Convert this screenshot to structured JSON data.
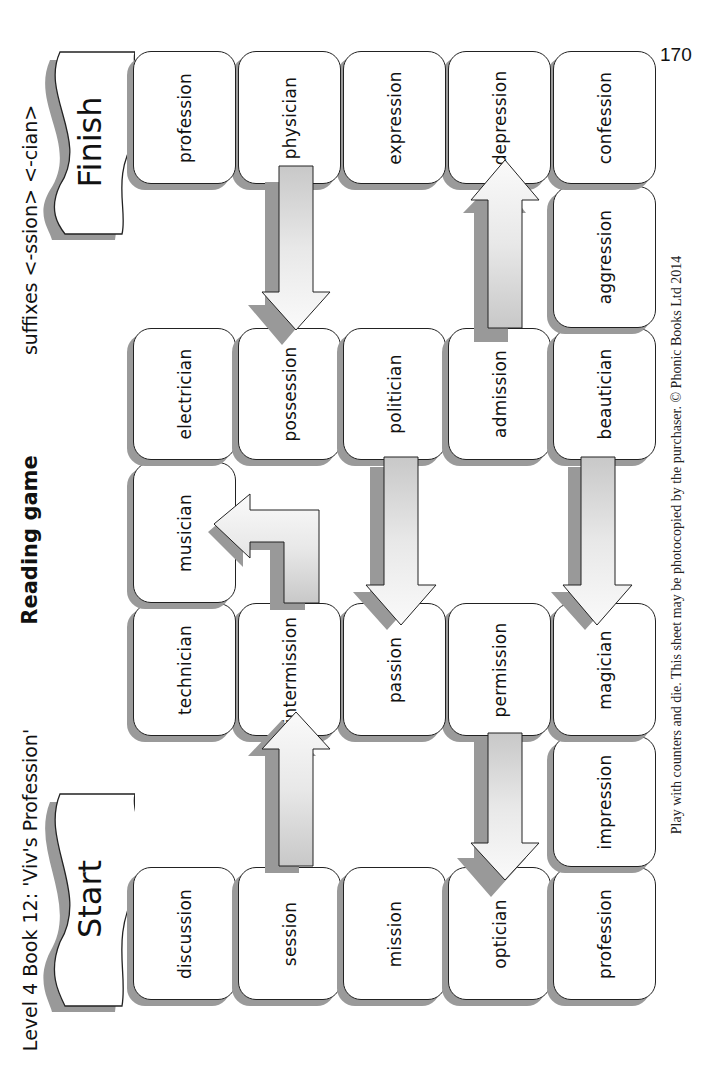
{
  "page_number": "170",
  "header": {
    "book_title": "Level 4 Book 12:  'Viv's Profession'",
    "game_title": "Reading game",
    "suffixes": "suffixes <-ssion> <-cian>"
  },
  "banners": {
    "start": "Start",
    "finish": "Finish"
  },
  "footer": "Play with counters and die. This sheet may be photocopied by the purchaser.  © Phonic Books Ltd 2014",
  "board": {
    "cells": [
      {
        "id": "c1",
        "word": "discussion"
      },
      {
        "id": "c2",
        "word": "session"
      },
      {
        "id": "c3",
        "word": "mission"
      },
      {
        "id": "c4",
        "word": "optician"
      },
      {
        "id": "c5",
        "word": "profession"
      },
      {
        "id": "c6",
        "word": "impression"
      },
      {
        "id": "c7",
        "word": "magician"
      },
      {
        "id": "c8",
        "word": "permission"
      },
      {
        "id": "c9",
        "word": "passion"
      },
      {
        "id": "c10",
        "word": "intermission"
      },
      {
        "id": "c11",
        "word": "technician"
      },
      {
        "id": "c12",
        "word": "musician"
      },
      {
        "id": "c13",
        "word": "electrician"
      },
      {
        "id": "c14",
        "word": "possession"
      },
      {
        "id": "c15",
        "word": "politician"
      },
      {
        "id": "c16",
        "word": "admission"
      },
      {
        "id": "c17",
        "word": "beautician"
      },
      {
        "id": "c18",
        "word": "aggression"
      },
      {
        "id": "c19",
        "word": "confession"
      },
      {
        "id": "c20",
        "word": "depression"
      },
      {
        "id": "c21",
        "word": "expression"
      },
      {
        "id": "c22",
        "word": "physician"
      },
      {
        "id": "c23",
        "word": "profession"
      }
    ],
    "arrows": [
      {
        "from": "session",
        "to": "intermission",
        "type": "ladder"
      },
      {
        "from": "intermission",
        "to": "musician",
        "type": "ladder"
      },
      {
        "from": "permission",
        "to": "optician",
        "type": "chute"
      },
      {
        "from": "beautician",
        "to": "magician",
        "type": "chute"
      },
      {
        "from": "politician",
        "to": "passion",
        "type": "chute"
      },
      {
        "from": "admission",
        "to": "depression",
        "type": "ladder"
      },
      {
        "from": "physician",
        "to": "possession",
        "type": "chute"
      }
    ]
  }
}
